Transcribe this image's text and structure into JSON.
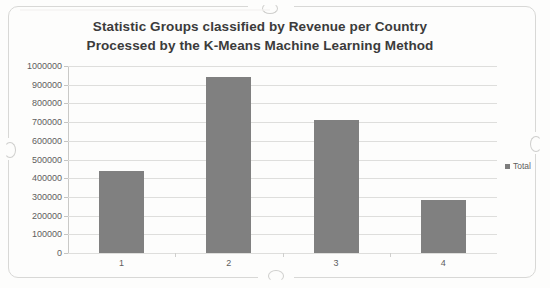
{
  "chart_data": {
    "type": "bar",
    "title": "Statistic Groups classified by Revenue per Country Processed by the K-Means Machine Learning Method",
    "title_line1": "Statistic Groups classified by Revenue per Country",
    "title_line2": "Processed by the K-Means Machine Learning Method",
    "xlabel": "",
    "ylabel": "",
    "categories": [
      "1",
      "2",
      "3",
      "4"
    ],
    "series": [
      {
        "name": "Total",
        "values": [
          440000,
          940000,
          710000,
          285000
        ],
        "color": "#808080"
      }
    ],
    "ylim": [
      0,
      1000000
    ],
    "ytick_step": 100000,
    "ytick_labels": [
      "1000000",
      "900000",
      "800000",
      "700000",
      "600000",
      "500000",
      "400000",
      "300000",
      "200000",
      "100000",
      "0"
    ],
    "ytick_values": [
      1000000,
      900000,
      800000,
      700000,
      600000,
      500000,
      400000,
      300000,
      200000,
      100000,
      0
    ],
    "grid": true,
    "legend_position": "right",
    "legend_entries": [
      "Total"
    ]
  },
  "legend": {
    "total_label": "Total",
    "swatch_icon": "legend-square-icon"
  }
}
